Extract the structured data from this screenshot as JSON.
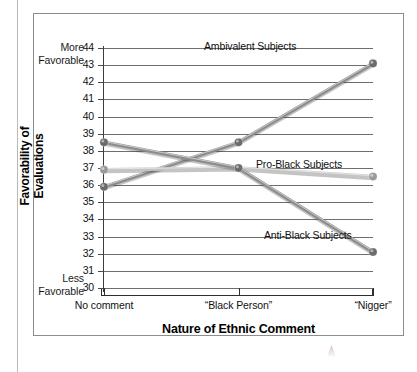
{
  "figure": {
    "y_endcap_top": "More\nFavorable",
    "y_endcap_top_line1": "More",
    "y_endcap_top_line2": "Favorable",
    "y_endcap_bottom_line1": "Less",
    "y_endcap_bottom_line2": "Favorable",
    "y_axis_title_line1": "Favorability of",
    "y_axis_title_line2": "Evaluations",
    "x_axis_title": "Nature of Ethnic Comment"
  },
  "chart_data": {
    "type": "line",
    "title": "",
    "xlabel": "Nature of Ethnic Comment",
    "ylabel": "Favorability of Evaluations",
    "categories": [
      "No comment",
      "“Black Person”",
      "“Nigger”"
    ],
    "ylim": [
      30,
      44
    ],
    "yticks": [
      30,
      31,
      32,
      33,
      34,
      35,
      36,
      37,
      38,
      39,
      40,
      41,
      42,
      43,
      44
    ],
    "ytick_labels": [
      "30",
      "31",
      "32",
      "33",
      "34",
      "35",
      "36",
      "37",
      "38",
      "39",
      "40",
      "41",
      "42",
      "43",
      "44"
    ],
    "y_axis_high_annotation": "More Favorable",
    "y_axis_low_annotation": "Less Favorable",
    "grid": true,
    "legend_position": "inline-annotations",
    "series": [
      {
        "name": "Ambivalent Subjects",
        "values": [
          35.9,
          38.5,
          43.1
        ],
        "color": "#8c8c8c",
        "marker_color": "#6b6b6b"
      },
      {
        "name": "Pro-Black Subjects",
        "values": [
          36.9,
          37.0,
          36.5
        ],
        "color": "#c4c4c4",
        "marker_color": "#9a9a9a"
      },
      {
        "name": "Anti-Black Subjects",
        "values": [
          38.5,
          37.0,
          32.1
        ],
        "color": "#8c8c8c",
        "marker_color": "#6b6b6b"
      }
    ],
    "annotations": [
      {
        "text": "Ambivalent Subjects",
        "series": "Ambivalent Subjects"
      },
      {
        "text": "Pro-Black Subjects",
        "series": "Pro-Black Subjects"
      },
      {
        "text": "Anti-Black Subjects",
        "series": "Anti-Black Subjects"
      }
    ]
  }
}
